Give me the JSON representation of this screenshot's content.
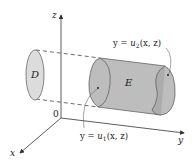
{
  "figure": {
    "axes": {
      "z_label": "z",
      "y_label": "y",
      "x_label": "x",
      "origin_label": "0"
    },
    "regions": {
      "projection_label": "D",
      "solid_label": "E"
    },
    "surfaces": {
      "upper": {
        "lhs": "y = ",
        "func": "u",
        "sub": "2",
        "args": "(x, z)"
      },
      "lower": {
        "lhs": "y = ",
        "func": "u",
        "sub": "1",
        "args": "(x, z)"
      }
    },
    "colors": {
      "region_fill": "#d9d9d9",
      "solid_fill": "#b8b8b8",
      "solid_face": "#a8a8a8",
      "line": "#333333"
    }
  }
}
